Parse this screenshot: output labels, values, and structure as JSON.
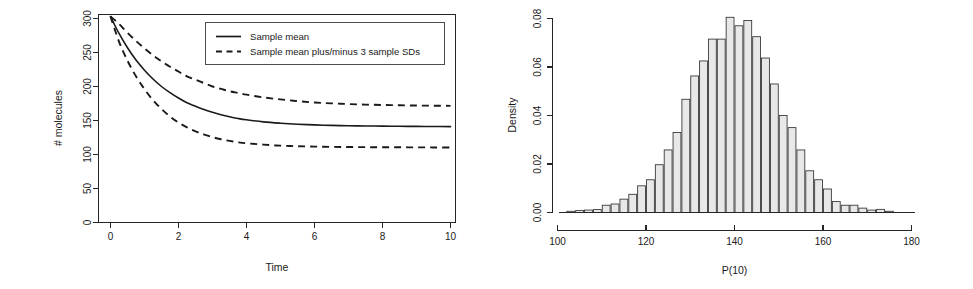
{
  "figure": {
    "panel_count": 2,
    "background_color": "#ffffff",
    "ink_color": "#1a1a1a"
  },
  "chart_data": [
    {
      "id": "molecules-vs-time",
      "type": "line",
      "title": "",
      "xlabel": "Time",
      "ylabel": "# molecules",
      "xlim": [
        0,
        10
      ],
      "ylim": [
        0,
        310
      ],
      "xticks": [
        0,
        2,
        4,
        6,
        8,
        10
      ],
      "xticklabels": [
        "0",
        "2",
        "4",
        "6",
        "8",
        "10"
      ],
      "yticks": [
        0,
        50,
        100,
        150,
        200,
        250,
        300
      ],
      "yticklabels": [
        "0",
        "50",
        "100",
        "150",
        "200",
        "250",
        "300"
      ],
      "grid": false,
      "box": true,
      "legend": {
        "position": "top-right",
        "entries": [
          {
            "label": "Sample mean",
            "style": "solid"
          },
          {
            "label": "Sample mean plus/minus 3 sample SDs",
            "style": "dashed"
          }
        ]
      },
      "x": [
        0,
        0.25,
        0.5,
        0.75,
        1,
        1.25,
        1.5,
        1.75,
        2,
        2.25,
        2.5,
        2.75,
        3,
        3.25,
        3.5,
        3.75,
        4,
        4.5,
        5,
        5.5,
        6,
        6.5,
        7,
        7.5,
        8,
        8.5,
        9,
        9.5,
        10
      ],
      "series": [
        {
          "name": "Sample mean",
          "style": "solid",
          "values": [
            303,
            278,
            257,
            239,
            224,
            211,
            200,
            191,
            183,
            176,
            171,
            166,
            162,
            158.5,
            155.5,
            153,
            151,
            148,
            146,
            144.5,
            143.5,
            142.8,
            142.3,
            142,
            141.7,
            141.5,
            141.3,
            141.2,
            141
          ]
        },
        {
          "name": "Sample mean plus 3 sample SDs",
          "style": "dashed",
          "values": [
            303,
            292,
            279,
            267,
            256,
            246,
            237,
            229,
            222,
            215,
            210,
            205,
            200,
            196.5,
            193,
            190.5,
            188,
            184,
            181,
            178.5,
            176.5,
            175.2,
            174.2,
            173.4,
            172.8,
            172.4,
            172,
            171.8,
            171.5
          ]
        },
        {
          "name": "Sample mean minus 3 sample SDs",
          "style": "dashed",
          "values": [
            303,
            266,
            238,
            215,
            196,
            180,
            167,
            156,
            147,
            140,
            134,
            129.5,
            125.5,
            122.5,
            120,
            118,
            116.5,
            114.5,
            113,
            112.2,
            111.6,
            111.2,
            111,
            110.8,
            110.7,
            110.6,
            110.5,
            110.4,
            110.3
          ]
        }
      ]
    },
    {
      "id": "p10-density-histogram",
      "type": "bar",
      "subtype": "histogram",
      "title": "",
      "xlabel": "P(10)",
      "ylabel": "Density",
      "xlim": [
        100,
        180
      ],
      "ylim": [
        0,
        0.082
      ],
      "xticks": [
        100,
        120,
        140,
        160,
        180
      ],
      "xticklabels": [
        "100",
        "120",
        "140",
        "160",
        "180"
      ],
      "yticks": [
        0.0,
        0.02,
        0.04,
        0.06,
        0.08
      ],
      "yticklabels": [
        "0.00",
        "0.02",
        "0.04",
        "0.06",
        "0.08"
      ],
      "grid": false,
      "box": false,
      "bin_width": 2,
      "bin_starts": [
        102,
        104,
        106,
        108,
        110,
        112,
        114,
        116,
        118,
        120,
        122,
        124,
        126,
        128,
        130,
        132,
        134,
        136,
        138,
        140,
        142,
        144,
        146,
        148,
        150,
        152,
        154,
        156,
        158,
        160,
        162,
        164,
        166,
        168,
        170,
        172,
        174
      ],
      "categories": [
        "102",
        "104",
        "106",
        "108",
        "110",
        "112",
        "114",
        "116",
        "118",
        "120",
        "122",
        "124",
        "126",
        "128",
        "130",
        "132",
        "134",
        "136",
        "138",
        "140",
        "142",
        "144",
        "146",
        "148",
        "150",
        "152",
        "154",
        "156",
        "158",
        "160",
        "162",
        "164",
        "166",
        "168",
        "170",
        "172",
        "174"
      ],
      "values": [
        0.0005,
        0.0008,
        0.001,
        0.0012,
        0.003,
        0.0035,
        0.0055,
        0.0075,
        0.011,
        0.0135,
        0.0197,
        0.0258,
        0.033,
        0.0467,
        0.0563,
        0.0625,
        0.0715,
        0.0715,
        0.0805,
        0.077,
        0.0792,
        0.0725,
        0.0637,
        0.053,
        0.04,
        0.035,
        0.0258,
        0.0172,
        0.0135,
        0.0097,
        0.0045,
        0.003,
        0.003,
        0.0018,
        0.001,
        0.0013,
        0.0005
      ],
      "bar_fill_color": "#e8e8e8",
      "bar_edge_color": "#303030"
    }
  ]
}
